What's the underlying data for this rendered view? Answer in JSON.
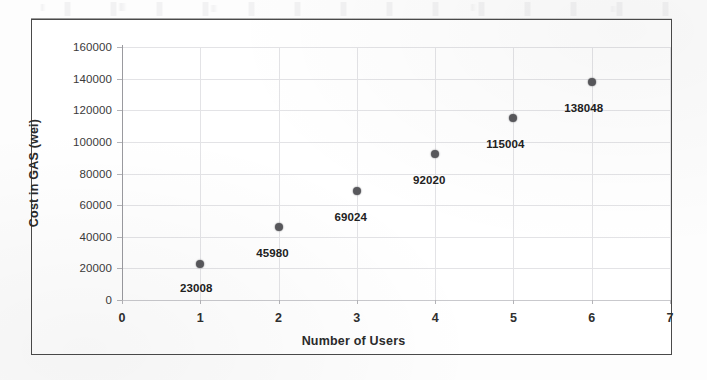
{
  "chart_data": {
    "type": "scatter",
    "title": "",
    "xlabel": "Number of Users",
    "ylabel": "Cost in GAS (wei)",
    "x": [
      1,
      2,
      3,
      4,
      5,
      6
    ],
    "values": [
      23008,
      45980,
      69024,
      92020,
      115004,
      138048
    ],
    "point_labels": [
      "23008",
      "45980",
      "69024",
      "92020",
      "115004",
      "138048"
    ],
    "xlim": [
      0,
      7
    ],
    "ylim": [
      0,
      160000
    ],
    "xticks": [
      "0",
      "1",
      "2",
      "3",
      "4",
      "5",
      "6",
      "7"
    ],
    "yticks": [
      "0",
      "20000",
      "40000",
      "60000",
      "80000",
      "100000",
      "120000",
      "140000",
      "160000"
    ],
    "grid": true,
    "legend": "none",
    "marker_color": "#58585c",
    "gridline_color": "#e3e3e6",
    "axis_color": "#9a9a9f"
  }
}
